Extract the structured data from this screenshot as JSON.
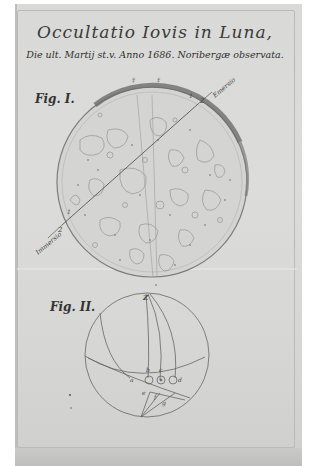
{
  "document": {
    "title": "Occultatio Iovis in Luna,",
    "subtitle": "Die ult. Martij st.v. Anno 1686. Noribergæ observata.",
    "colors": {
      "paper": "#d9d9d7",
      "ink": "#3a3a3a",
      "moon_limb": "#7a7a78",
      "margin": "#ffffff"
    }
  },
  "figures": [
    {
      "label": "Fig. I.",
      "description": "Moon disc with maculae and the chord of Jupiter's passage",
      "annotations": {
        "emersion": "Emersio",
        "immersion": "Immersio",
        "chord_end_top": "2",
        "chord_end_bottom": "2",
        "chord_point_top": "1",
        "chord_point_bottom": "1"
      }
    },
    {
      "label": "Fig. II.",
      "description": "Circle diagram with arcs and Jupiter positions",
      "annotations": {
        "zenith": "Z",
        "points": [
          "a",
          "b",
          "c",
          "d",
          "e",
          "f",
          "g"
        ]
      }
    }
  ]
}
